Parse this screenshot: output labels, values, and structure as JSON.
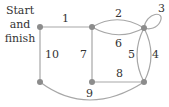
{
  "diagram": {
    "type": "graph",
    "start_label_line1": "Start",
    "start_label_line2": "and",
    "start_label_line3": "finish",
    "colors": {
      "edge": "#a7a7a7",
      "node": "#8c8c8c",
      "text": "#333333"
    },
    "nodes": [
      {
        "id": "A",
        "x": 40,
        "y": 27,
        "role": "start-finish"
      },
      {
        "id": "B",
        "x": 92,
        "y": 27
      },
      {
        "id": "C",
        "x": 144,
        "y": 28
      },
      {
        "id": "D",
        "x": 40,
        "y": 82
      },
      {
        "id": "E",
        "x": 92,
        "y": 82
      },
      {
        "id": "F",
        "x": 144,
        "y": 82
      }
    ],
    "edges": [
      {
        "label": "1",
        "from": "A",
        "to": "B"
      },
      {
        "label": "2",
        "from": "B",
        "to": "C"
      },
      {
        "label": "3",
        "from": "C",
        "to": "C"
      },
      {
        "label": "4",
        "from": "C",
        "to": "F"
      },
      {
        "label": "5",
        "from": "C",
        "to": "F"
      },
      {
        "label": "6",
        "from": "B",
        "to": "C"
      },
      {
        "label": "7",
        "from": "B",
        "to": "E"
      },
      {
        "label": "8",
        "from": "E",
        "to": "F"
      },
      {
        "label": "9",
        "from": "D",
        "to": "F"
      },
      {
        "label": "10",
        "from": "A",
        "to": "D"
      }
    ]
  }
}
